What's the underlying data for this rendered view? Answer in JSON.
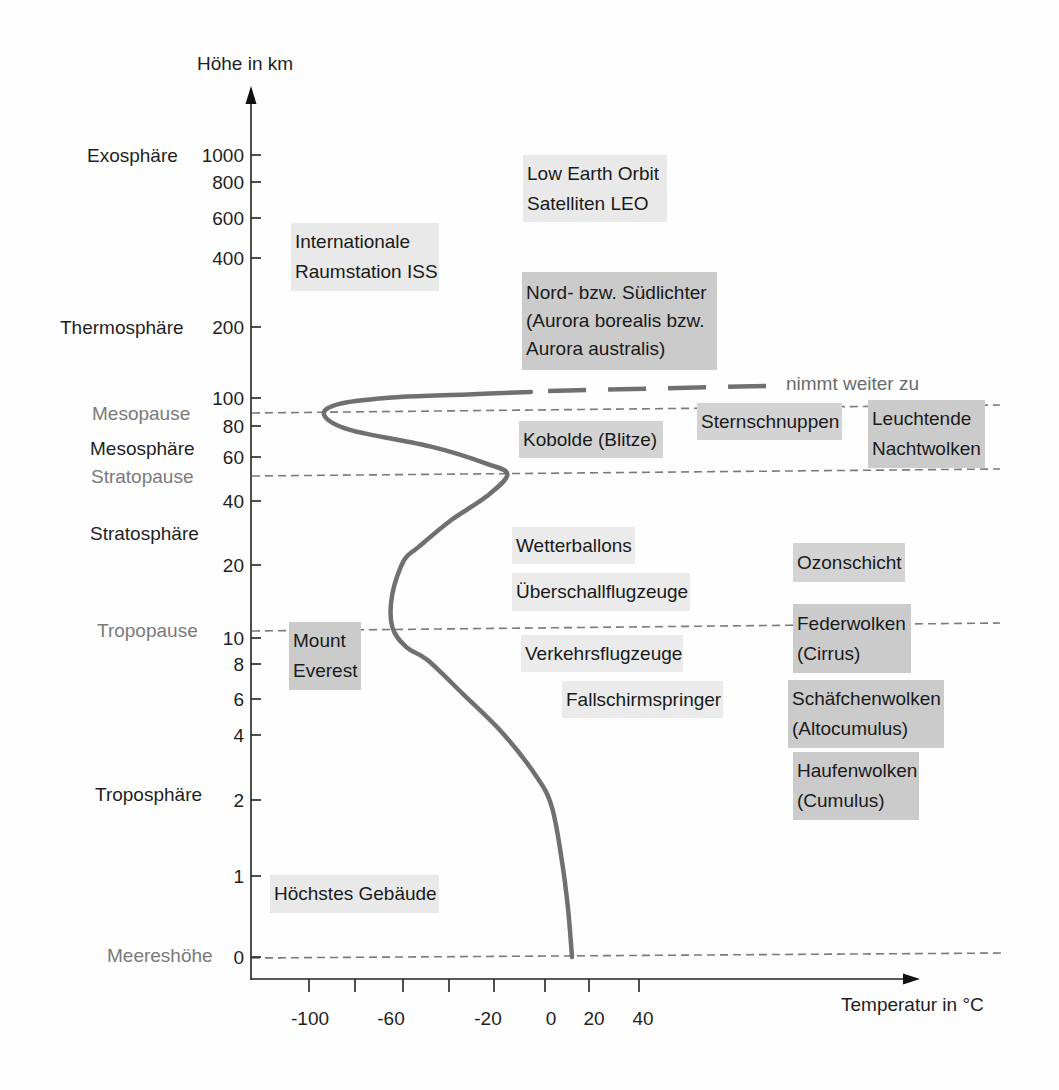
{
  "chart_data": {
    "type": "line",
    "title": "",
    "xlabel": "Temperatur in °C",
    "ylabel": "Höhe in km",
    "x_ticks": [
      -100,
      -80,
      -60,
      -40,
      -20,
      0,
      20,
      40
    ],
    "x_tick_labels": [
      "-100",
      "-60",
      "-20",
      "0",
      "20",
      "40"
    ],
    "y_ticks": [
      0,
      1,
      2,
      4,
      6,
      8,
      10,
      20,
      40,
      60,
      80,
      100,
      200,
      400,
      600,
      800,
      1000
    ],
    "y_scale": "non-linear",
    "grid": false,
    "legend": null,
    "series": [
      {
        "name": "",
        "color": "#707070",
        "x": [
          11.5,
          9.8,
          7.2,
          3,
          -3.4,
          -18,
          -35,
          -50,
          -59,
          -65,
          -65,
          -60,
          -54,
          -40,
          -25,
          -16,
          -25,
          -48,
          -83,
          -94,
          -87,
          -62,
          -33,
          -6
        ],
        "y": [
          0,
          0.6,
          1.2,
          1.9,
          2.7,
          4.1,
          6.3,
          8.3,
          9.3,
          11.5,
          16,
          21.5,
          25.5,
          34,
          42,
          52,
          57,
          66.5,
          77.5,
          88,
          96,
          101.4,
          105,
          108.5
        ],
        "extrapolated_x": [
          1.3,
          96
        ],
        "extrapolated_y": [
          110,
          117
        ],
        "extrapolated_label": "nimmt weiter zu"
      }
    ],
    "layers": [
      {
        "name": "Exosphäre"
      },
      {
        "name": "Thermosphäre"
      },
      {
        "name": "Mesosphäre"
      },
      {
        "name": "Stratosphäre"
      },
      {
        "name": "Troposphäre"
      }
    ],
    "boundaries": [
      {
        "label": "Mesopause",
        "altitude_km": 89
      },
      {
        "label": "Stratopause",
        "altitude_km": 51
      },
      {
        "label": "Tropopause",
        "altitude_km": 11
      },
      {
        "label": "Meereshöhe",
        "altitude_km": 0
      }
    ],
    "annotations": [
      {
        "lines": [
          "Low Earth Orbit",
          "Satelliten LEO"
        ],
        "fill": "#e9e9e9"
      },
      {
        "lines": [
          "Internationale",
          "Raumstation ISS"
        ],
        "fill": "#e9e9e9"
      },
      {
        "lines": [
          "Nord- bzw. Südlichter",
          "(Aurora borealis bzw.",
          "Aurora australis)"
        ],
        "fill": "#cbcbcb"
      },
      {
        "lines": [
          "Sternschnuppen"
        ],
        "fill": "#d3d3d3"
      },
      {
        "lines": [
          "Leuchtende",
          "Nachtwolken"
        ],
        "fill": "#cbcbcb"
      },
      {
        "lines": [
          "Kobolde (Blitze)"
        ],
        "fill": "#d3d3d3"
      },
      {
        "lines": [
          "Wetterballons"
        ],
        "fill": "#ebebeb"
      },
      {
        "lines": [
          "Überschallflugzeuge"
        ],
        "fill": "#ebebeb"
      },
      {
        "lines": [
          "Ozonschicht"
        ],
        "fill": "#d3d3d3"
      },
      {
        "lines": [
          "Federwolken",
          "(Cirrus)"
        ],
        "fill": "#cbcbcb"
      },
      {
        "lines": [
          "Mount",
          "Everest"
        ],
        "fill": "#cbcbcb"
      },
      {
        "lines": [
          "Verkehrsflugzeuge"
        ],
        "fill": "#ebebeb"
      },
      {
        "lines": [
          "Fallschirmspringer"
        ],
        "fill": "#ebebeb"
      },
      {
        "lines": [
          "Schäfchenwolken",
          "(Altocumulus)"
        ],
        "fill": "#cbcbcb"
      },
      {
        "lines": [
          "Haufenwolken",
          "(Cumulus)"
        ],
        "fill": "#cbcbcb"
      },
      {
        "lines": [
          "Höchstes Gebäude"
        ],
        "fill": "#e9e9e9"
      }
    ]
  }
}
